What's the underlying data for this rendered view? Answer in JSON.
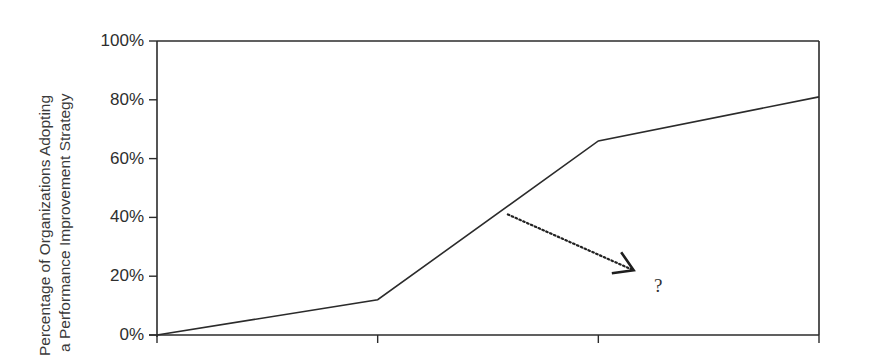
{
  "chart_data": {
    "type": "line",
    "title": "",
    "xlabel": "",
    "ylabel": "Percentage of Organizations Adopting a Performance Improvement Strategy",
    "ylabel_lines": [
      "Percentage of Organizations Adopting",
      "a Performance Improvement Strategy"
    ],
    "y_ticks": [
      "0%",
      "20%",
      "40%",
      "60%",
      "80%",
      "100%"
    ],
    "y_tick_values": [
      0,
      20,
      40,
      60,
      80,
      100
    ],
    "ylim": [
      0,
      100
    ],
    "x_ticks_count": 4,
    "x_tick_labels": [],
    "grid": false,
    "legend": null,
    "series": [
      {
        "name": "Adoption",
        "x": [
          0,
          1,
          2,
          3
        ],
        "values": [
          0,
          12,
          66,
          81
        ]
      }
    ],
    "annotations": [
      {
        "type": "dotted-arrow",
        "from_x": 1.59,
        "from_y": 41,
        "to_x": 2.16,
        "to_y": 22,
        "label": "?"
      }
    ]
  },
  "colors": {
    "line": "#2b2b2b",
    "axis": "#2b2b2b",
    "text": "#333333",
    "background": "#ffffff"
  }
}
